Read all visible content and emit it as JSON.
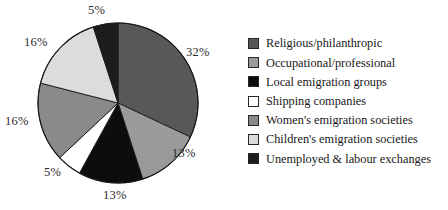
{
  "chart_data": {
    "type": "pie",
    "title": "",
    "subtitle": "",
    "xlabel": "",
    "ylabel": "",
    "legend_position": "right",
    "grid": false,
    "units": "percent",
    "start_angle_deg": 0,
    "direction": "clockwise",
    "categories": [
      "Religious/philanthropic",
      "Occupational/professional",
      "Local emigration groups",
      "Shipping companies",
      "Women's emigration societies",
      "Children's emigration societies",
      "Unemployed & labour exchanges"
    ],
    "values": [
      32,
      13,
      13,
      5,
      16,
      16,
      5
    ],
    "value_labels": [
      "32%",
      "13%",
      "13%",
      "5%",
      "16%",
      "16%",
      "5%"
    ],
    "colors": [
      "#585858",
      "#9a9a9a",
      "#0d0d0d",
      "#ffffff",
      "#8a8a8a",
      "#dcdcdc",
      "#1c1c1c"
    ],
    "slices": [
      {
        "label": "Religious/philanthropic",
        "value": 32,
        "value_label": "32%",
        "color": "#585858",
        "start_deg": 0,
        "end_deg": 115.2
      },
      {
        "label": "Occupational/professional",
        "value": 13,
        "value_label": "13%",
        "color": "#9a9a9a",
        "start_deg": 115.2,
        "end_deg": 162.0
      },
      {
        "label": "Local emigration groups",
        "value": 13,
        "value_label": "13%",
        "color": "#0d0d0d",
        "start_deg": 162.0,
        "end_deg": 208.8
      },
      {
        "label": "Shipping companies",
        "value": 5,
        "value_label": "5%",
        "color": "#ffffff",
        "start_deg": 208.8,
        "end_deg": 226.8
      },
      {
        "label": "Women's emigration societies",
        "value": 16,
        "value_label": "16%",
        "color": "#8a8a8a",
        "start_deg": 226.8,
        "end_deg": 284.4
      },
      {
        "label": "Children's emigration societies",
        "value": 16,
        "value_label": "16%",
        "color": "#dcdcdc",
        "start_deg": 284.4,
        "end_deg": 342.0
      },
      {
        "label": "Unemployed & labour exchanges",
        "value": 5,
        "value_label": "5%",
        "color": "#1c1c1c",
        "start_deg": 342.0,
        "end_deg": 360.0
      }
    ]
  },
  "pie": {
    "center_x": 118,
    "center_y": 103,
    "radius": 80,
    "outline_color": "#1a1a1a",
    "labels": [
      {
        "text": "32%",
        "x": 186,
        "y": 46,
        "for": "Religious/philanthropic"
      },
      {
        "text": "13%",
        "x": 172,
        "y": 147,
        "for": "Occupational/professional"
      },
      {
        "text": "13%",
        "x": 103,
        "y": 189,
        "for": "Local emigration groups"
      },
      {
        "text": "5%",
        "x": 44,
        "y": 166,
        "for": "Shipping companies"
      },
      {
        "text": "16%",
        "x": 5,
        "y": 115,
        "for": "Women's emigration societies"
      },
      {
        "text": "16%",
        "x": 24,
        "y": 36,
        "for": "Children's emigration societies"
      },
      {
        "text": "5%",
        "x": 88,
        "y": 4,
        "for": "Unemployed & labour exchanges"
      }
    ]
  },
  "legend": {
    "items": [
      {
        "label": "Religious/philanthropic",
        "color": "#585858"
      },
      {
        "label": "Occupational/professional",
        "color": "#9a9a9a"
      },
      {
        "label": "Local emigration groups",
        "color": "#0d0d0d"
      },
      {
        "label": "Shipping companies",
        "color": "#ffffff"
      },
      {
        "label": "Women's emigration societies",
        "color": "#8a8a8a"
      },
      {
        "label": "Children's emigration societies",
        "color": "#dcdcdc"
      },
      {
        "label": "Unemployed & labour exchanges",
        "color": "#1c1c1c"
      }
    ]
  }
}
